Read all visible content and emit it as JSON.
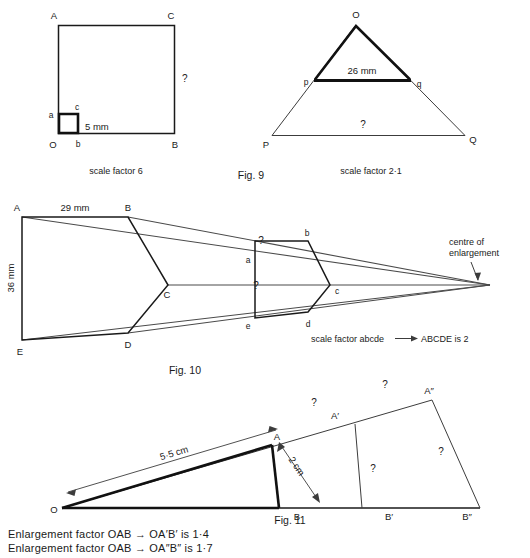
{
  "page": {
    "background": "#ffffff",
    "ink": "#1a1a1a"
  },
  "figures": [
    {
      "id": "fig9",
      "caption": "Fig. 9",
      "panels": [
        {
          "id": "fig9-left",
          "shape": "square-enlargement",
          "sub_caption": "scale factor 6",
          "vertex_labels": {
            "big_top_left": "A",
            "big_top_right": "C",
            "big_bottom_left": "O",
            "big_bottom_right": "B",
            "small_top_left": "a",
            "small_top_right": "c",
            "small_bottom_right": "b"
          },
          "dimensions": [
            {
              "name": "small-square-side",
              "text": "5 mm"
            },
            {
              "name": "big-square-side",
              "text": "?"
            }
          ]
        },
        {
          "id": "fig9-right",
          "shape": "triangle-enlargement",
          "sub_caption": "scale factor 2·1",
          "vertex_labels": {
            "apex": "O",
            "big_left": "P",
            "big_right": "Q",
            "small_left": "p",
            "small_right": "q"
          },
          "dimensions": [
            {
              "name": "small-triangle-base",
              "text": "26 mm"
            },
            {
              "name": "big-triangle-base",
              "text": "?"
            }
          ]
        }
      ]
    },
    {
      "id": "fig10",
      "caption": "Fig. 10",
      "shape": "pentagon-enlargement",
      "sub_caption": "scale factor abcde —→ ABCDE is 2",
      "scale_factor_text_parts": {
        "prefix": "scale factor abcde",
        "arrow": "⟶",
        "suffix": "ABCDE is 2"
      },
      "annotation": "centre of\nenlargement",
      "annotation_line1": "centre of",
      "annotation_line2": "enlargement",
      "vertex_labels": {
        "big_a": "A",
        "big_b": "B",
        "big_c": "C",
        "big_d": "D",
        "big_e": "E",
        "small_a": "a",
        "small_b": "b",
        "small_c": "c",
        "small_d": "d",
        "small_e": "e"
      },
      "dimensions": [
        {
          "name": "big-ab-side",
          "text": "29 mm"
        },
        {
          "name": "big-ae-side",
          "text": "36 mm"
        },
        {
          "name": "small-ab-side",
          "text": "?"
        },
        {
          "name": "small-width",
          "text": "?"
        }
      ]
    },
    {
      "id": "fig11",
      "caption": "Fig. 11",
      "shape": "triangle-successive-enlargement",
      "vertex_labels": {
        "origin": "O",
        "a": "A",
        "b": "B",
        "a_prime": "A′",
        "b_prime": "B′",
        "a_double_prime": "A″",
        "b_double_prime": "B″"
      },
      "dimensions": [
        {
          "name": "oa-length",
          "text": "5·5 cm"
        },
        {
          "name": "ab-height",
          "text": "2 cm"
        },
        {
          "name": "oa-prime-unknown",
          "text": "?"
        },
        {
          "name": "oa-double-prime-unknown",
          "text": "?"
        },
        {
          "name": "a-prime-b-prime-unknown",
          "text": "?"
        },
        {
          "name": "a-double-prime-b-double-prime-unknown",
          "text": "?"
        }
      ]
    }
  ],
  "footer": {
    "line1": "Enlargement factor OAB → OA′B′ is 1·4",
    "line2": "Enlargement factor OAB → OA″B″ is 1·7"
  }
}
